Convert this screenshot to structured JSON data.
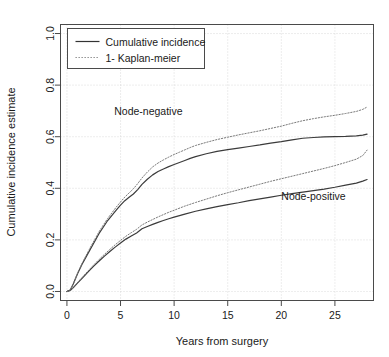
{
  "chart_data": {
    "type": "line",
    "title": "",
    "xlabel": "Years from surgery",
    "ylabel": "Cumulative incidence estimate",
    "xlim": [
      -0.6,
      28.6
    ],
    "ylim": [
      -0.035,
      1.035
    ],
    "xticks": [
      0,
      5,
      10,
      15,
      20,
      25
    ],
    "xtick_labels": [
      "0",
      "5",
      "10",
      "15",
      "20",
      "25"
    ],
    "yticks": [
      0.0,
      0.2,
      0.4,
      0.6,
      0.8,
      1.0
    ],
    "ytick_labels": [
      "0.0",
      "0.2",
      "0.4",
      "0.6",
      "0.8",
      "1.0"
    ],
    "grid": true,
    "grid_style": "dotted",
    "grid_color": "#cccccc",
    "legend": {
      "position": "top-left",
      "entries": [
        {
          "label": "Cumulative incidence",
          "style": "solid",
          "color": "#333333"
        },
        {
          "label": "1- Kaplan-meier",
          "style": "dotted",
          "color": "#808080"
        }
      ]
    },
    "annotations": [
      {
        "text": "Node-negative",
        "x": 7.6,
        "y": 0.685
      },
      {
        "text": "Node-positive",
        "x": 23.0,
        "y": 0.355
      }
    ],
    "series": [
      {
        "name": "Node-negative cumulative incidence",
        "group": "Node-negative",
        "style": "solid",
        "color": "#3b3b3b",
        "x": [
          0,
          0.3,
          0.6,
          1.0,
          1.4,
          1.8,
          2.2,
          2.6,
          3.0,
          3.4,
          3.8,
          4.2,
          4.6,
          5.0,
          5.4,
          5.8,
          6.2,
          6.6,
          7.0,
          7.5,
          8.0,
          8.5,
          9.0,
          9.5,
          10.0,
          10.5,
          11.0,
          11.5,
          12.0,
          13.0,
          14.0,
          15.0,
          16.0,
          17.0,
          18.0,
          19.0,
          20.0,
          21.0,
          22.0,
          23.0,
          24.0,
          25.0,
          26.0,
          27.0,
          27.6,
          28.0
        ],
        "y": [
          0.0,
          0.005,
          0.03,
          0.07,
          0.105,
          0.135,
          0.165,
          0.195,
          0.225,
          0.25,
          0.275,
          0.295,
          0.315,
          0.335,
          0.352,
          0.365,
          0.378,
          0.395,
          0.415,
          0.435,
          0.452,
          0.465,
          0.475,
          0.484,
          0.492,
          0.5,
          0.508,
          0.516,
          0.523,
          0.534,
          0.543,
          0.55,
          0.556,
          0.562,
          0.568,
          0.575,
          0.581,
          0.588,
          0.594,
          0.597,
          0.599,
          0.6,
          0.601,
          0.603,
          0.606,
          0.61
        ]
      },
      {
        "name": "Node-negative 1- Kaplan-meier",
        "group": "Node-negative",
        "style": "dotted",
        "color": "#7a7a7a",
        "x": [
          0,
          0.3,
          0.6,
          1.0,
          1.4,
          1.8,
          2.2,
          2.6,
          3.0,
          3.4,
          3.8,
          4.2,
          4.6,
          5.0,
          5.4,
          5.8,
          6.2,
          6.6,
          7.0,
          7.5,
          8.0,
          8.5,
          9.0,
          9.5,
          10.0,
          10.5,
          11.0,
          11.5,
          12.0,
          13.0,
          14.0,
          15.0,
          16.0,
          17.0,
          18.0,
          19.0,
          20.0,
          21.0,
          22.0,
          23.0,
          24.0,
          25.0,
          26.0,
          27.0,
          27.6,
          28.0
        ],
        "y": [
          0.0,
          0.005,
          0.03,
          0.072,
          0.108,
          0.14,
          0.172,
          0.202,
          0.232,
          0.258,
          0.283,
          0.305,
          0.327,
          0.347,
          0.366,
          0.382,
          0.398,
          0.418,
          0.44,
          0.463,
          0.483,
          0.498,
          0.51,
          0.521,
          0.531,
          0.54,
          0.549,
          0.558,
          0.566,
          0.578,
          0.589,
          0.598,
          0.607,
          0.615,
          0.623,
          0.632,
          0.641,
          0.652,
          0.662,
          0.67,
          0.677,
          0.683,
          0.69,
          0.698,
          0.706,
          0.715
        ]
      },
      {
        "name": "Node-positive cumulative incidence",
        "group": "Node-positive",
        "style": "solid",
        "color": "#3b3b3b",
        "x": [
          0,
          0.3,
          0.6,
          1.0,
          1.5,
          2.0,
          2.5,
          3.0,
          3.5,
          4.0,
          4.5,
          5.0,
          5.5,
          6.0,
          6.5,
          7.0,
          7.5,
          8.0,
          8.5,
          9.0,
          9.5,
          10.0,
          11.0,
          12.0,
          13.0,
          14.0,
          15.0,
          16.0,
          17.0,
          18.0,
          19.0,
          20.0,
          21.0,
          22.0,
          23.0,
          24.0,
          25.0,
          26.0,
          27.0,
          27.6,
          28.0
        ],
        "y": [
          0.0,
          0.004,
          0.015,
          0.033,
          0.055,
          0.077,
          0.098,
          0.118,
          0.137,
          0.155,
          0.172,
          0.188,
          0.203,
          0.215,
          0.227,
          0.243,
          0.252,
          0.26,
          0.268,
          0.275,
          0.282,
          0.288,
          0.3,
          0.311,
          0.32,
          0.329,
          0.337,
          0.344,
          0.352,
          0.359,
          0.366,
          0.373,
          0.379,
          0.385,
          0.391,
          0.397,
          0.404,
          0.412,
          0.42,
          0.428,
          0.434
        ]
      },
      {
        "name": "Node-positive 1- Kaplan-meier",
        "group": "Node-positive",
        "style": "dotted",
        "color": "#7a7a7a",
        "x": [
          0,
          0.3,
          0.6,
          1.0,
          1.5,
          2.0,
          2.5,
          3.0,
          3.5,
          4.0,
          4.5,
          5.0,
          5.5,
          6.0,
          6.5,
          7.0,
          7.5,
          8.0,
          8.5,
          9.0,
          9.5,
          10.0,
          11.0,
          12.0,
          13.0,
          14.0,
          15.0,
          16.0,
          17.0,
          18.0,
          19.0,
          20.0,
          21.0,
          22.0,
          23.0,
          24.0,
          25.0,
          26.0,
          27.0,
          27.6,
          28.0
        ],
        "y": [
          0.0,
          0.004,
          0.016,
          0.035,
          0.058,
          0.081,
          0.103,
          0.124,
          0.144,
          0.163,
          0.181,
          0.198,
          0.214,
          0.228,
          0.241,
          0.258,
          0.269,
          0.279,
          0.289,
          0.298,
          0.307,
          0.315,
          0.331,
          0.345,
          0.358,
          0.371,
          0.383,
          0.394,
          0.405,
          0.416,
          0.427,
          0.437,
          0.447,
          0.457,
          0.467,
          0.477,
          0.488,
          0.5,
          0.513,
          0.527,
          0.548
        ]
      }
    ]
  }
}
